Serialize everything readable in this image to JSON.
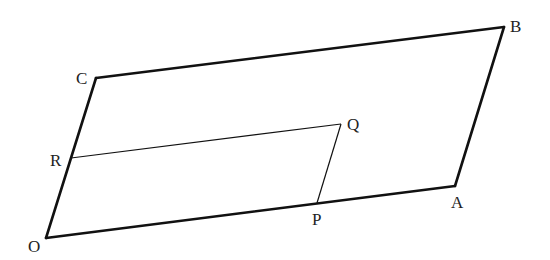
{
  "diagram": {
    "type": "geometry",
    "shape": "parallelogram",
    "points": {
      "O": {
        "label": "O",
        "x": 46,
        "y": 238,
        "lx": 28,
        "ly": 252
      },
      "A": {
        "label": "A",
        "x": 455,
        "y": 186,
        "lx": 451,
        "ly": 208
      },
      "B": {
        "label": "B",
        "x": 504,
        "y": 27,
        "lx": 510,
        "ly": 32
      },
      "C": {
        "label": "C",
        "x": 96,
        "y": 78,
        "lx": 76,
        "ly": 84
      },
      "P": {
        "label": "P",
        "x": 317,
        "y": 203,
        "lx": 312,
        "ly": 225
      },
      "Q": {
        "label": "Q",
        "x": 341,
        "y": 124,
        "lx": 347,
        "ly": 130
      },
      "R": {
        "label": "R",
        "x": 71,
        "y": 158,
        "lx": 50,
        "ly": 166
      }
    },
    "edges_thick": [
      [
        "O",
        "A"
      ],
      [
        "A",
        "B"
      ],
      [
        "B",
        "C"
      ],
      [
        "C",
        "O"
      ]
    ],
    "edges_thin": [
      [
        "R",
        "Q"
      ],
      [
        "Q",
        "P"
      ]
    ],
    "stroke_color": "#111111",
    "background": "#ffffff"
  }
}
